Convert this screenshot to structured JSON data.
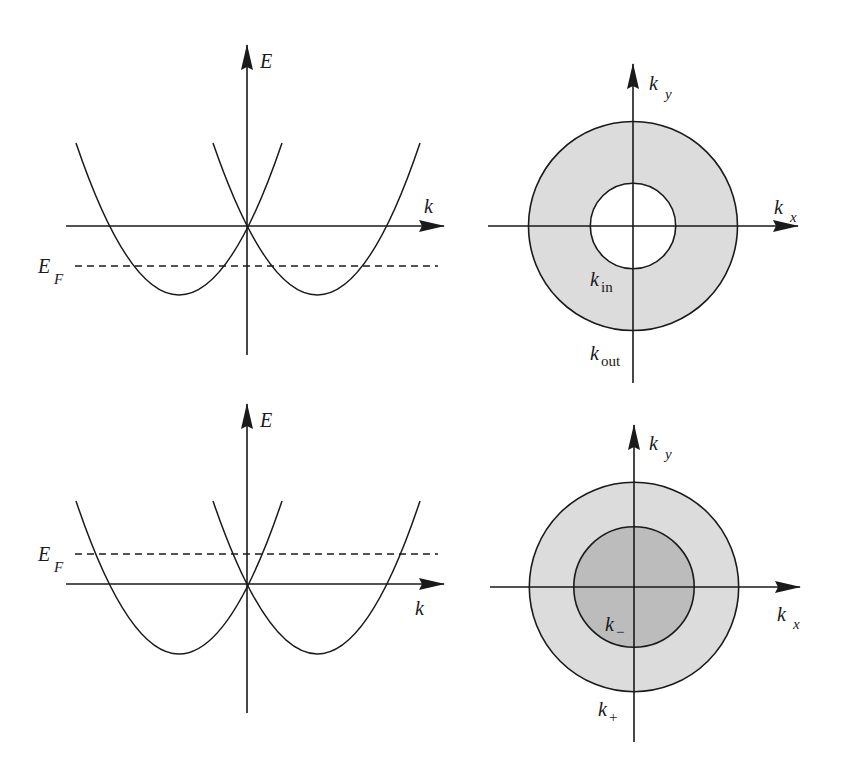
{
  "panels": {
    "top_left": {
      "title": "Dispersion with Fermi level below band crossing",
      "y_axis_label": "E",
      "x_axis_label": "k",
      "fermi_label_main": "E",
      "fermi_label_sub": "F"
    },
    "top_right": {
      "title": "Annular Fermi sea",
      "y_axis_label_main": "k",
      "y_axis_label_sub": "y",
      "x_axis_label_main": "k",
      "x_axis_label_sub": "x",
      "inner_label_main": "k",
      "inner_label_sub": "in",
      "outer_label_main": "k",
      "outer_label_sub": "out"
    },
    "bottom_left": {
      "title": "Dispersion with Fermi level above band crossing",
      "y_axis_label": "E",
      "x_axis_label": "k",
      "fermi_label_main": "E",
      "fermi_label_sub": "F"
    },
    "bottom_right": {
      "title": "Two concentric Fermi surfaces",
      "y_axis_label_main": "k",
      "y_axis_label_sub": "y",
      "x_axis_label_main": "k",
      "x_axis_label_sub": "x",
      "inner_label_main": "k",
      "inner_label_sub": "−",
      "outer_label_main": "k",
      "outer_label_sub": "+"
    }
  },
  "colors": {
    "line": "#1a1a1a",
    "fill_light": "#dcdcdc",
    "fill_dark": "#bcbcbc",
    "background": "#ffffff"
  }
}
